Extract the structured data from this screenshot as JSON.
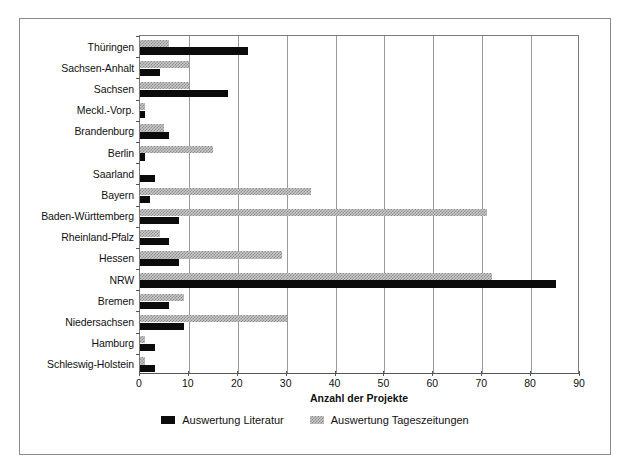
{
  "chart_data": {
    "type": "bar",
    "orientation": "horizontal",
    "title": "",
    "xlabel": "Anzahl der Projekte",
    "ylabel": "",
    "xlim": [
      0,
      90
    ],
    "xticks": [
      0,
      10,
      20,
      30,
      40,
      50,
      60,
      70,
      80,
      90
    ],
    "grid": "vertical",
    "legend_position": "bottom-center",
    "categories": [
      "Thüringen",
      "Sachsen-Anhalt",
      "Sachsen",
      "Meckl.-Vorp.",
      "Brandenburg",
      "Berlin",
      "Saarland",
      "Bayern",
      "Baden-Württemberg",
      "Rheinland-Pfalz",
      "Hessen",
      "NRW",
      "Bremen",
      "Niedersachsen",
      "Hamburg",
      "Schleswig-Holstein"
    ],
    "series": [
      {
        "name": "Auswertung Literatur",
        "color": "#0b0b0b",
        "pattern": "solid",
        "values": [
          22,
          4,
          18,
          1,
          6,
          1,
          3,
          2,
          8,
          6,
          8,
          85,
          6,
          9,
          3,
          3
        ]
      },
      {
        "name": "Auswertung Tageszeitungen",
        "color": "#c9c9c9",
        "pattern": "checker",
        "values": [
          6,
          10,
          10,
          1,
          5,
          15,
          0,
          35,
          71,
          4,
          29,
          72,
          9,
          30,
          1,
          1
        ]
      }
    ]
  },
  "legend": {
    "items": [
      {
        "label": "Auswertung Literatur"
      },
      {
        "label": "Auswertung Tageszeitungen"
      }
    ]
  },
  "colors": {
    "series_literatur": "#0b0b0b",
    "series_tageszeitungen": "#c9c9c9",
    "frame": "#8c8c8c",
    "gridline": "#9a9a9a",
    "axis": "#555555",
    "text": "#111111",
    "background": "#ffffff"
  }
}
